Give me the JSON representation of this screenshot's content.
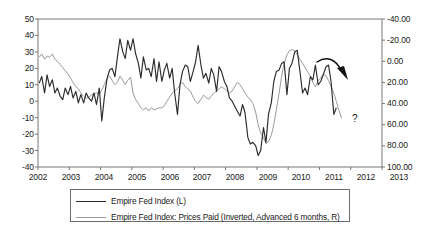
{
  "chart_data": {
    "type": "line",
    "title": "",
    "subtitle": "",
    "xlabel": "",
    "ylabel": "",
    "grid": false,
    "legend_position": "bottom",
    "x_axis": {
      "tick_labels": [
        "2002",
        "2003",
        "2004",
        "2005",
        "2006",
        "2007",
        "2008",
        "2009",
        "2010",
        "2011",
        "2012",
        "2013"
      ],
      "range": [
        2002,
        2013
      ]
    },
    "y_axis_left": {
      "label": "Empire Fed Index",
      "tick_labels": [
        "50",
        "40",
        "30",
        "20",
        "10",
        "0",
        "-10",
        "-20",
        "-30",
        "-40"
      ],
      "ticks": [
        50,
        40,
        30,
        20,
        10,
        0,
        -10,
        -20,
        -30,
        -40
      ],
      "range": [
        -40,
        50
      ],
      "inverted": false
    },
    "y_axis_right": {
      "label": "Empire Fed Index: Prices Paid (Inverted)",
      "tick_labels": [
        "-40.00",
        "-20.00",
        "0.00",
        "20.00",
        "40.00",
        "60.00",
        "80.00",
        "100.00"
      ],
      "ticks": [
        -40,
        -20,
        0,
        20,
        40,
        60,
        80,
        100
      ],
      "range": [
        -40,
        100
      ],
      "inverted": true
    },
    "annotations": [
      {
        "name": "trend-arrow",
        "text": "",
        "shape": "curved-arrow-down-right"
      },
      {
        "name": "question-mark",
        "text": "?"
      }
    ],
    "series": [
      {
        "name": "Empire Fed Index (L)",
        "axis": "left",
        "color": "#2b2b2b",
        "x": [
          2002.04,
          2002.12,
          2002.21,
          2002.29,
          2002.37,
          2002.46,
          2002.54,
          2002.62,
          2002.71,
          2002.79,
          2002.87,
          2002.96,
          2003.04,
          2003.12,
          2003.21,
          2003.29,
          2003.37,
          2003.46,
          2003.54,
          2003.62,
          2003.71,
          2003.79,
          2003.87,
          2003.96,
          2004.04,
          2004.12,
          2004.21,
          2004.29,
          2004.37,
          2004.46,
          2004.54,
          2004.62,
          2004.71,
          2004.79,
          2004.87,
          2004.96,
          2005.04,
          2005.12,
          2005.21,
          2005.29,
          2005.37,
          2005.46,
          2005.54,
          2005.62,
          2005.71,
          2005.79,
          2005.87,
          2005.96,
          2006.04,
          2006.12,
          2006.21,
          2006.29,
          2006.37,
          2006.46,
          2006.54,
          2006.62,
          2006.71,
          2006.79,
          2006.87,
          2006.96,
          2007.04,
          2007.12,
          2007.21,
          2007.29,
          2007.37,
          2007.46,
          2007.54,
          2007.62,
          2007.71,
          2007.79,
          2007.87,
          2007.96,
          2008.04,
          2008.12,
          2008.21,
          2008.29,
          2008.37,
          2008.46,
          2008.54,
          2008.62,
          2008.71,
          2008.79,
          2008.87,
          2008.96,
          2009.04,
          2009.12,
          2009.21,
          2009.29,
          2009.37,
          2009.46,
          2009.54,
          2009.62,
          2009.71,
          2009.79,
          2009.87,
          2009.96,
          2010.04,
          2010.12,
          2010.21,
          2010.29,
          2010.37,
          2010.46,
          2010.54,
          2010.62,
          2010.71,
          2010.79,
          2010.87,
          2010.96,
          2011.04,
          2011.12,
          2011.21,
          2011.29,
          2011.37,
          2011.46,
          2011.54
        ],
        "values": [
          11,
          15,
          5,
          16,
          9,
          13,
          5,
          8,
          3,
          1,
          8,
          4,
          9,
          2,
          6,
          -1,
          4,
          -1,
          5,
          2,
          0,
          5,
          -2,
          8,
          -12,
          2,
          14,
          19,
          20,
          15,
          27,
          38,
          30,
          26,
          37,
          31,
          38,
          29,
          23,
          14,
          27,
          19,
          20,
          15,
          26,
          12,
          24,
          12,
          19,
          23,
          14,
          20,
          5,
          -8,
          10,
          18,
          22,
          21,
          12,
          18,
          24,
          34,
          22,
          14,
          17,
          11,
          20,
          16,
          6,
          21,
          18,
          12,
          9,
          2,
          0,
          -3,
          -6,
          -9,
          -2,
          -7,
          -22,
          -26,
          -25,
          -27,
          -33,
          -30,
          -16,
          -25,
          -8,
          -1,
          12,
          18,
          19,
          23,
          24,
          4,
          20,
          23,
          30,
          31,
          19,
          5,
          8,
          4,
          15,
          13,
          22,
          10,
          12,
          16,
          21,
          22,
          12,
          -8,
          -4
        ]
      },
      {
        "name": "Empire Fed Index: Prices Paid (Inverted, Advanced 6 months, R)",
        "axis": "right",
        "color": "#9a9a9a",
        "x": [
          2002.04,
          2002.12,
          2002.21,
          2002.29,
          2002.37,
          2002.46,
          2002.54,
          2002.62,
          2002.71,
          2002.79,
          2002.87,
          2002.96,
          2003.04,
          2003.12,
          2003.21,
          2003.29,
          2003.37,
          2003.46,
          2003.54,
          2003.62,
          2003.71,
          2003.79,
          2003.87,
          2003.96,
          2004.04,
          2004.12,
          2004.21,
          2004.29,
          2004.37,
          2004.46,
          2004.54,
          2004.62,
          2004.71,
          2004.79,
          2004.87,
          2004.96,
          2005.04,
          2005.12,
          2005.21,
          2005.29,
          2005.37,
          2005.46,
          2005.54,
          2005.62,
          2005.71,
          2005.79,
          2005.87,
          2005.96,
          2006.04,
          2006.12,
          2006.21,
          2006.29,
          2006.37,
          2006.46,
          2006.54,
          2006.62,
          2006.71,
          2006.79,
          2006.87,
          2006.96,
          2007.04,
          2007.12,
          2007.21,
          2007.29,
          2007.37,
          2007.46,
          2007.54,
          2007.62,
          2007.71,
          2007.79,
          2007.87,
          2007.96,
          2008.04,
          2008.12,
          2008.21,
          2008.29,
          2008.37,
          2008.46,
          2008.54,
          2008.62,
          2008.71,
          2008.79,
          2008.87,
          2008.96,
          2009.04,
          2009.12,
          2009.21,
          2009.29,
          2009.37,
          2009.46,
          2009.54,
          2009.62,
          2009.71,
          2009.79,
          2009.87,
          2009.96,
          2010.04,
          2010.12,
          2010.21,
          2010.29,
          2010.37,
          2010.46,
          2010.54,
          2010.62,
          2010.71,
          2010.79,
          2010.87,
          2010.96,
          2011.04,
          2011.12,
          2011.21,
          2011.29,
          2011.37,
          2011.46,
          2011.54,
          2011.62,
          2011.71
        ],
        "values": [
          -4,
          -7,
          -2,
          -5,
          -4,
          -7,
          -2,
          0,
          3,
          6,
          9,
          12,
          16,
          20,
          24,
          26,
          30,
          33,
          35,
          34,
          32,
          31,
          30,
          31,
          27,
          22,
          16,
          14,
          18,
          22,
          20,
          14,
          18,
          22,
          18,
          15,
          30,
          36,
          40,
          44,
          46,
          44,
          47,
          44,
          46,
          45,
          44,
          44,
          42,
          38,
          34,
          30,
          28,
          26,
          22,
          20,
          24,
          26,
          28,
          34,
          38,
          40,
          36,
          32,
          34,
          36,
          33,
          30,
          28,
          26,
          24,
          26,
          28,
          30,
          28,
          24,
          20,
          22,
          26,
          30,
          34,
          36,
          40,
          48,
          60,
          68,
          72,
          78,
          76,
          70,
          60,
          46,
          30,
          14,
          2,
          -6,
          -10,
          -11,
          -10,
          -6,
          -2,
          2,
          6,
          10,
          14,
          20,
          24,
          18,
          16,
          12,
          14,
          18,
          24,
          30,
          38,
          46,
          54
        ]
      }
    ]
  },
  "legend": {
    "items": [
      {
        "label": "Empire Fed Index (L)",
        "color": "#2b2b2b"
      },
      {
        "label": "Empire Fed Index: Prices Paid (Inverted, Advanced 6 months, R)",
        "color": "#9a9a9a"
      }
    ]
  },
  "annotations": {
    "question_mark": "?"
  },
  "colors": {
    "series_dark": "#2b2b2b",
    "series_light": "#9a9a9a",
    "axis": "#555555",
    "legend_border": "#6b6b6b",
    "background": "#ffffff"
  }
}
